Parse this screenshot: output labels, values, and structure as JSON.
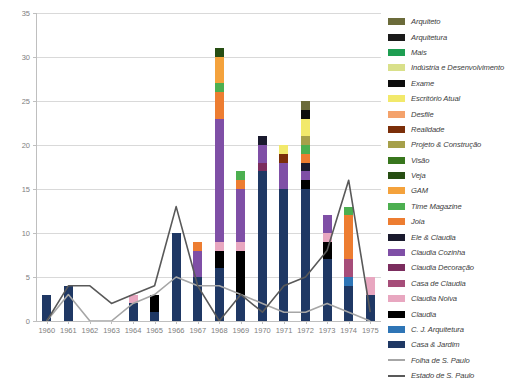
{
  "chart_data": {
    "type": "bar",
    "title": "",
    "xlabel": "",
    "ylabel": "",
    "ylim": [
      0,
      35
    ],
    "ytick_step": 5,
    "yticks": [
      "0",
      "5",
      "10",
      "15",
      "20",
      "25",
      "30",
      "35"
    ],
    "grid": true,
    "stacked": true,
    "legend_position": "right",
    "categories": [
      "1960",
      "1961",
      "1962",
      "1963",
      "1964",
      "1965",
      "1966",
      "1967",
      "1968",
      "1969",
      "1970",
      "1971",
      "1972",
      "1973",
      "1974",
      "1975"
    ],
    "series": [
      {
        "name": "Casa & Jardim",
        "color": "#1f3864",
        "values": [
          3,
          4,
          0,
          0,
          2,
          1,
          10,
          5,
          6,
          3,
          17,
          15,
          15,
          7,
          4,
          3
        ]
      },
      {
        "name": "C. J. Arquitetura",
        "color": "#2e75b6",
        "values": [
          0,
          0,
          0,
          0,
          0,
          0,
          0,
          0,
          0,
          0,
          0,
          0,
          0,
          0,
          1,
          0
        ]
      },
      {
        "name": "Claudia",
        "color": "#000000",
        "values": [
          0,
          0,
          0,
          0,
          0,
          2,
          0,
          0,
          2,
          5,
          0,
          0,
          1,
          2,
          0,
          0
        ]
      },
      {
        "name": "Claudia Noiva",
        "color": "#e8a7c0",
        "values": [
          0,
          0,
          0,
          0,
          1,
          0,
          0,
          0,
          1,
          1,
          0,
          0,
          0,
          1,
          0,
          2
        ]
      },
      {
        "name": "Casa de Claudia",
        "color": "#a64d79",
        "values": [
          0,
          0,
          0,
          0,
          0,
          0,
          0,
          0,
          0,
          0,
          0,
          0,
          0,
          0,
          2,
          0
        ]
      },
      {
        "name": "Claudia Decoração",
        "color": "#7b2d5e",
        "values": [
          0,
          0,
          0,
          0,
          0,
          0,
          0,
          0,
          0,
          0,
          1,
          0,
          0,
          0,
          0,
          0
        ]
      },
      {
        "name": "Claudia Cozinha",
        "color": "#7f4fa6",
        "values": [
          0,
          0,
          0,
          0,
          0,
          0,
          0,
          3,
          14,
          6,
          2,
          3,
          1,
          2,
          0,
          0
        ]
      },
      {
        "name": "Ele & Claudia",
        "color": "#1a1a2e",
        "values": [
          0,
          0,
          0,
          0,
          0,
          0,
          0,
          0,
          0,
          0,
          1,
          0,
          1,
          0,
          0,
          0
        ]
      },
      {
        "name": "Joia",
        "color": "#ed7d31",
        "values": [
          0,
          0,
          0,
          0,
          0,
          0,
          0,
          1,
          3,
          1,
          0,
          0,
          1,
          0,
          5,
          0
        ]
      },
      {
        "name": "Time Magazine",
        "color": "#4caf50",
        "values": [
          0,
          0,
          0,
          0,
          0,
          0,
          0,
          0,
          1,
          1,
          0,
          0,
          1,
          0,
          1,
          0
        ]
      },
      {
        "name": "GAM",
        "color": "#f4a23c",
        "values": [
          0,
          0,
          0,
          0,
          0,
          0,
          0,
          0,
          3,
          0,
          0,
          0,
          0,
          0,
          0,
          0
        ]
      },
      {
        "name": "Veja",
        "color": "#274e13",
        "values": [
          0,
          0,
          0,
          0,
          0,
          0,
          0,
          0,
          1,
          0,
          0,
          0,
          0,
          0,
          0,
          0
        ]
      },
      {
        "name": "Visão",
        "color": "#38761d",
        "values": [
          0,
          0,
          0,
          0,
          0,
          0,
          0,
          0,
          0,
          0,
          0,
          0,
          0,
          0,
          0,
          0
        ]
      },
      {
        "name": "Projeto & Construção",
        "color": "#a6a04a",
        "values": [
          0,
          0,
          0,
          0,
          0,
          0,
          0,
          0,
          0,
          0,
          0,
          0,
          1,
          0,
          0,
          0
        ]
      },
      {
        "name": "Realidade",
        "color": "#7b2e09",
        "values": [
          0,
          0,
          0,
          0,
          0,
          0,
          0,
          0,
          0,
          0,
          0,
          1,
          0,
          0,
          0,
          0
        ]
      },
      {
        "name": "Desfile",
        "color": "#f4a26b",
        "values": [
          0,
          0,
          0,
          0,
          0,
          0,
          0,
          0,
          0,
          0,
          0,
          0,
          0,
          0,
          0,
          0
        ]
      },
      {
        "name": "Escritório Atual",
        "color": "#f2e96b",
        "values": [
          0,
          0,
          0,
          0,
          0,
          0,
          0,
          0,
          0,
          0,
          0,
          1,
          2,
          0,
          0,
          0
        ]
      },
      {
        "name": "Exame",
        "color": "#0d0d0d",
        "values": [
          0,
          0,
          0,
          0,
          0,
          0,
          0,
          0,
          0,
          0,
          0,
          0,
          1,
          0,
          0,
          0
        ]
      },
      {
        "name": "Indústria e Desenvolvimento",
        "color": "#d9e08a",
        "values": [
          0,
          0,
          0,
          0,
          0,
          0,
          0,
          0,
          0,
          0,
          0,
          0,
          0,
          0,
          0,
          0
        ]
      },
      {
        "name": "Mais",
        "color": "#1e9e52",
        "values": [
          0,
          0,
          0,
          0,
          0,
          0,
          0,
          0,
          0,
          0,
          0,
          0,
          0,
          0,
          0,
          0
        ]
      },
      {
        "name": "Arquitetura",
        "color": "#1a1a1a",
        "values": [
          0,
          0,
          0,
          0,
          0,
          0,
          0,
          0,
          0,
          0,
          0,
          0,
          0,
          0,
          0,
          0
        ]
      },
      {
        "name": "Arquiteto",
        "color": "#6b6b3a",
        "values": [
          0,
          0,
          0,
          0,
          0,
          0,
          0,
          0,
          0,
          0,
          0,
          0,
          1,
          0,
          0,
          0
        ]
      }
    ],
    "line_series": [
      {
        "name": "Folha de S. Paulo",
        "color": "#a6a6a6",
        "values": [
          0,
          3,
          0,
          0,
          2,
          3,
          5,
          4,
          4,
          3,
          2,
          1,
          1,
          2,
          1,
          0
        ]
      },
      {
        "name": "Estado de S. Paulo",
        "color": "#595959",
        "values": [
          0,
          4,
          4,
          2,
          3,
          4,
          13,
          4,
          0,
          3,
          1,
          4,
          5,
          8,
          16,
          1
        ]
      }
    ],
    "legend": [
      {
        "label": "Arquiteto",
        "color": "#6b6b3a",
        "type": "swatch"
      },
      {
        "label": "Arquitetura",
        "color": "#1a1a1a",
        "type": "swatch"
      },
      {
        "label": "Mais",
        "color": "#1e9e52",
        "type": "swatch"
      },
      {
        "label": "Indústria e Desenvolvimento",
        "color": "#d9e08a",
        "type": "swatch"
      },
      {
        "label": "Exame",
        "color": "#0d0d0d",
        "type": "swatch"
      },
      {
        "label": "Escritório Atual",
        "color": "#f2e96b",
        "type": "swatch"
      },
      {
        "label": "Desfile",
        "color": "#f4a26b",
        "type": "swatch"
      },
      {
        "label": "Realidade",
        "color": "#7b2e09",
        "type": "swatch"
      },
      {
        "label": "Projeto & Construção",
        "color": "#a6a04a",
        "type": "swatch"
      },
      {
        "label": "Visão",
        "color": "#38761d",
        "type": "swatch"
      },
      {
        "label": "Veja",
        "color": "#274e13",
        "type": "swatch"
      },
      {
        "label": "GAM",
        "color": "#f4a23c",
        "type": "swatch"
      },
      {
        "label": "Time Magazine",
        "color": "#4caf50",
        "type": "swatch"
      },
      {
        "label": "Joia",
        "color": "#ed7d31",
        "type": "swatch"
      },
      {
        "label": "Ele & Claudia",
        "color": "#1a1a2e",
        "type": "swatch"
      },
      {
        "label": "Claudia Cozinha",
        "color": "#7f4fa6",
        "type": "swatch"
      },
      {
        "label": "Claudia Decoração",
        "color": "#7b2d5e",
        "type": "swatch"
      },
      {
        "label": "Casa de Claudia",
        "color": "#a64d79",
        "type": "swatch"
      },
      {
        "label": "Claudia Noiva",
        "color": "#e8a7c0",
        "type": "swatch"
      },
      {
        "label": "Claudia",
        "color": "#000000",
        "type": "swatch"
      },
      {
        "label": "C. J. Arquitetura",
        "color": "#2e75b6",
        "type": "swatch"
      },
      {
        "label": "Casa & Jardim",
        "color": "#1f3864",
        "type": "swatch"
      },
      {
        "label": "Folha de S. Paulo",
        "color": "#a6a6a6",
        "type": "line"
      },
      {
        "label": "Estado de S. Paulo",
        "color": "#595959",
        "type": "line"
      }
    ]
  }
}
